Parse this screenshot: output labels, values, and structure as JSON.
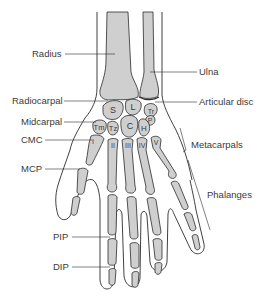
{
  "colors": {
    "bone_fill": "#cfcfcf",
    "outline": "#2b2b2b",
    "label": "#3a3a3a",
    "background": "#ffffff"
  },
  "labels_left": {
    "radius": "Radius",
    "radiocarpal": "Radiocarpal",
    "midcarpal": "Midcarpal",
    "cmc": "CMC",
    "mcp": "MCP",
    "pip": "PIP",
    "dip": "DIP"
  },
  "labels_right": {
    "ulna": "Ulna",
    "articular_disc": "Articular disc",
    "metacarpals": "Metacarpals",
    "phalanges": "Phalanges"
  },
  "carpals": {
    "scaphoid": "S",
    "lunate": "L",
    "triquetrum": "Tr",
    "pisiform": "P",
    "trapezium": "Tm",
    "trapezoid": "Tz",
    "capitate": "C",
    "hamate": "H"
  },
  "metacarpal_numerals": [
    "I",
    "II",
    "III",
    "IV",
    "V"
  ]
}
